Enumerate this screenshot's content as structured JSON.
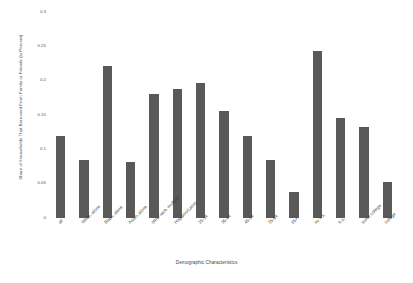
{
  "chart_data": {
    "type": "bar",
    "title": "",
    "xlabel": "Demographic Characteristics",
    "ylabel": "Share of Households That Borrowed From Family or Friends (in Percent)",
    "ylim": [
      0,
      0.3
    ],
    "yticks": [
      "0",
      "0.05",
      "0.1",
      "0.15",
      "0.2",
      "0.25",
      "0.3"
    ],
    "ytick_values": [
      0,
      0.05,
      0.1,
      0.15,
      0.2,
      0.25,
      0.3
    ],
    "grid": false,
    "legend": "none",
    "bar_color": "#595959",
    "categories": [
      "all",
      "White, alone",
      "Black, alone",
      "Asian, alone",
      "other race, multiple",
      "Hispanic/Latino",
      "25-34",
      "35-44",
      "45-54",
      "55-64",
      "65+",
      "no h.s.",
      "h.s.",
      "some college",
      "college"
    ],
    "values": [
      0.119,
      0.084,
      0.222,
      0.081,
      0.181,
      0.188,
      0.196,
      0.156,
      0.119,
      0.085,
      0.038,
      0.243,
      0.146,
      0.133,
      0.053
    ]
  }
}
